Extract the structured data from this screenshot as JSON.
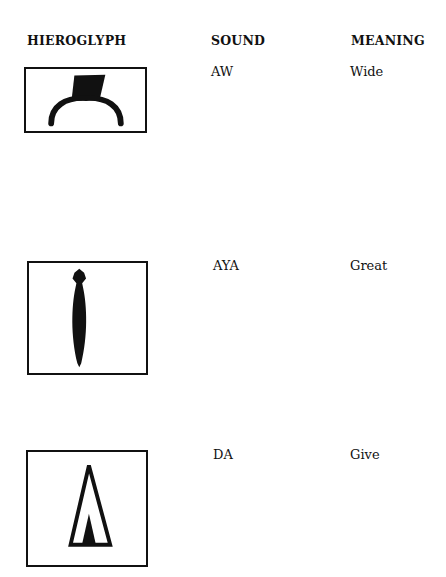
{
  "headers": {
    "hieroglyph": "HIEROGLYPH",
    "sound": "SOUND",
    "meaning": "MEANING"
  },
  "rows": [
    {
      "glyph_icon": "wide-hieroglyph-icon",
      "sound": "AW",
      "meaning": "Wide"
    },
    {
      "glyph_icon": "great-hieroglyph-icon",
      "sound": "AYA",
      "meaning": "Great"
    },
    {
      "glyph_icon": "give-hieroglyph-icon",
      "sound": "DA",
      "meaning": "Give"
    }
  ],
  "colors": {
    "ink": "#111111",
    "background": "#ffffff"
  }
}
